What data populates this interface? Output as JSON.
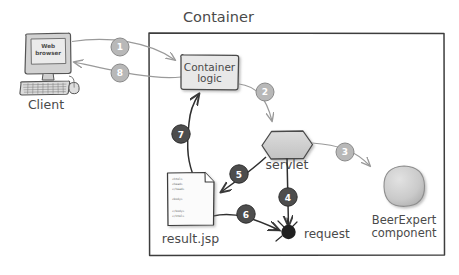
{
  "diagram": {
    "title_visible": "Container",
    "container": {
      "label": "Container"
    },
    "nodes": {
      "client": {
        "label": "Client",
        "screen_text_line1": "Web",
        "screen_text_line2": "browser",
        "icon": "desktop-computer-icon"
      },
      "container_logic": {
        "label_line1": "Container",
        "label_line2": "logic",
        "shape": "rounded-box"
      },
      "servlet": {
        "label": "servlet",
        "shape": "hexagon"
      },
      "beerexpert": {
        "label_line1": "BeerExpert",
        "label_line2": "component",
        "shape": "circle"
      },
      "request": {
        "label": "request",
        "shape": "filled-bug-circle"
      },
      "result_jsp": {
        "label": "result.jsp",
        "shape": "document-page",
        "code_lines": [
          "<html>",
          "<head>",
          "</head>",
          "",
          "<body>",
          "",
          "</body>",
          "</html>"
        ]
      }
    },
    "steps": [
      {
        "n": "1",
        "from": "client",
        "to": "container_logic",
        "style": "light"
      },
      {
        "n": "2",
        "from": "container_logic",
        "to": "servlet",
        "style": "light"
      },
      {
        "n": "3",
        "from": "servlet",
        "to": "beerexpert",
        "style": "light"
      },
      {
        "n": "4",
        "from": "servlet",
        "to": "request",
        "style": "dark"
      },
      {
        "n": "5",
        "from": "servlet",
        "to": "result_jsp",
        "style": "dark"
      },
      {
        "n": "6",
        "from": "result_jsp",
        "to": "request",
        "style": "dark"
      },
      {
        "n": "7",
        "from": "result_jsp",
        "to": "container_logic",
        "style": "dark"
      },
      {
        "n": "8",
        "from": "container_logic",
        "to": "client",
        "style": "light"
      }
    ],
    "colors": {
      "ink": "#4a4a4a",
      "line_light": "#9a9a9a",
      "line_dark": "#3a3a3a",
      "badge_light": "#b3b3b3",
      "badge_dark": "#4d4d4d",
      "fill_gray": "#cfcfcf",
      "background": "#ffffff"
    }
  }
}
